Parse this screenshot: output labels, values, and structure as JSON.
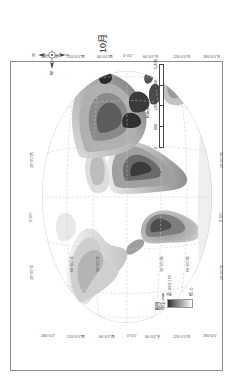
{
  "figure": {
    "caption": "10月",
    "background_color": "#ffffff",
    "frame_color": "#8d8d8d"
  },
  "legend": {
    "title": "图例",
    "unit_label": "单位: mm",
    "max_label": "高: 963.176",
    "min_label": "低: 0",
    "ramp_high_color": "#2b2b2b",
    "ramp_low_color": "#ffffff"
  },
  "scale_bar": {
    "title": "Miles",
    "ticks": [
      "0",
      "900",
      "1,800",
      "3,600",
      "5,400"
    ],
    "segments": 4
  },
  "compass": {
    "north": "N",
    "south": "S",
    "east": "E",
    "west": "W"
  },
  "map": {
    "projection_note": "world",
    "land_color_min": "#f2f2f2",
    "land_color_max": "#3a3a3a",
    "ocean_color": "#ffffff",
    "graticule_color": "#c9c9c9"
  },
  "coordinates": {
    "top": [
      {
        "label": "30°0'0\"东",
        "x": 92
      },
      {
        "label": "0°0'0\"",
        "x": 140
      },
      {
        "label": "30°0'0\"西",
        "x": 188
      }
    ],
    "bottom": [
      {
        "label": "30°0'0\"东",
        "x": 92
      },
      {
        "label": "0°0'0\"",
        "x": 140
      },
      {
        "label": "30°0'0\"西",
        "x": 188
      }
    ],
    "left_column": [
      {
        "label": "180°0'0\"",
        "y": 16
      },
      {
        "label": "120°0'0\"西",
        "y": 34
      },
      {
        "label": "60°0'0\"西",
        "y": 54
      },
      {
        "label": "0°0'0\"",
        "y": 76
      },
      {
        "label": "60°0'0\"东",
        "y": 98
      },
      {
        "label": "120°0'0\"东",
        "y": 120
      },
      {
        "label": "180°0'0\"",
        "y": 142
      }
    ],
    "right_column": [
      {
        "label": "180°0'0\"西",
        "y": 16
      },
      {
        "label": "120°0'0\"西",
        "y": 40
      },
      {
        "label": "60°0'0\"西",
        "y": 64
      },
      {
        "label": "0°0'0\"",
        "y": 88
      },
      {
        "label": "60°0'0\"东",
        "y": 112
      },
      {
        "label": "120°0'0\"东",
        "y": 136
      },
      {
        "label": "180°0'0\"东",
        "y": 160
      }
    ],
    "inner_north": [
      {
        "label": "30°0'0\"北",
        "x": 60
      },
      {
        "label": "60°0'0\"北",
        "x": 60
      }
    ],
    "inner_south": [
      {
        "label": "30°0'0\"南",
        "x": 60
      },
      {
        "label": "60°0'0\"南",
        "x": 60
      }
    ]
  }
}
